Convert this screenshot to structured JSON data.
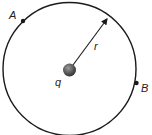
{
  "diagram": {
    "labels": {
      "point_a": "A",
      "point_b": "B",
      "radius": "r",
      "charge": "q"
    },
    "colors": {
      "stroke": "#1a1a1a",
      "charge_fill": "#555555"
    }
  }
}
